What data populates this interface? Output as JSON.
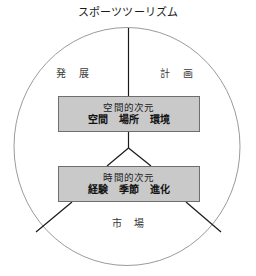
{
  "diagram": {
    "title": "スポーツツーリズム",
    "outer_shape": "ellipse",
    "outer_shape_color": "#8a8a8a",
    "connector_color": "#1a1a1a",
    "box_fill": "#c9c9c9",
    "box_border": "#6e6e6e",
    "quadrant_labels": {
      "top_left": "発 展",
      "top_right": "計 画",
      "bottom": "市 場"
    },
    "nodes": [
      {
        "id": "spatial",
        "title": "空間的次元",
        "items": "空間　場所　環境"
      },
      {
        "id": "temporal",
        "title": "時間的次元",
        "items": "経験　季節　進化"
      }
    ]
  }
}
